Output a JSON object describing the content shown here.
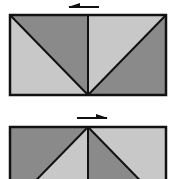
{
  "diagram": {
    "colors": {
      "dark": "#8a8a8a",
      "light": "#c8c8c8",
      "stroke": "#111111",
      "background": "#ffffff"
    },
    "panels": [
      {
        "arrow_direction": "left",
        "layout": "top-left dark, bottom-left light, top-right light, bottom-right dark; diagonals meet at bottom center"
      },
      {
        "arrow_direction": "right",
        "layout": "diagonals meet at top center; left half dark outer, right half light outer"
      }
    ]
  }
}
